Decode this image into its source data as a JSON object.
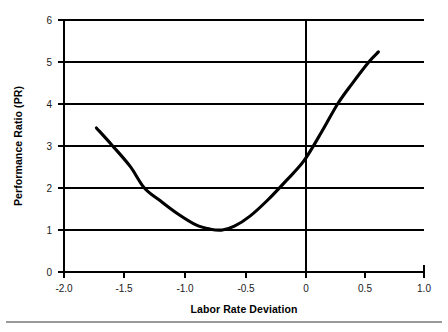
{
  "chart_data": {
    "type": "line",
    "title": "",
    "xlabel": "Labor Rate Deviation",
    "ylabel": "Performance Ratio (PR)",
    "xlim": [
      -2.0,
      1.0
    ],
    "ylim": [
      0,
      6
    ],
    "grid": "horizontal",
    "legend": "none",
    "xticks": [
      -2.0,
      -1.5,
      -1.0,
      -0.5,
      0,
      0.5,
      1.0
    ],
    "xticklabels": [
      "-2.0",
      "-1.5",
      "-1.0",
      "-0.5",
      "0",
      "0.5",
      "1.0"
    ],
    "yticks": [
      0,
      1,
      2,
      3,
      4,
      5,
      6
    ],
    "yticklabels": [
      "0",
      "1",
      "2",
      "3",
      "4",
      "5",
      "6"
    ],
    "annotations": [
      {
        "name": "vertical-reference-line",
        "x": 0
      }
    ],
    "series": [
      {
        "name": "Performance Ratio curve",
        "color": "#000000",
        "x": [
          -1.73,
          -1.6,
          -1.45,
          -1.33,
          -1.2,
          -1.05,
          -0.9,
          -0.78,
          -0.68,
          -0.58,
          -0.45,
          -0.3,
          -0.15,
          0.0,
          0.15,
          0.28,
          0.4,
          0.54,
          0.62
        ],
        "y": [
          3.43,
          3.02,
          2.52,
          2.0,
          1.7,
          1.38,
          1.12,
          1.02,
          1.0,
          1.09,
          1.33,
          1.72,
          2.17,
          2.65,
          3.35,
          4.0,
          4.48,
          5.0,
          5.24
        ],
        "minimum": {
          "x": -0.68,
          "y": 1.0
        },
        "endpoints": {
          "left": {
            "x": -1.73,
            "y": 3.43
          },
          "right": {
            "x": 0.62,
            "y": 5.24
          }
        }
      }
    ]
  },
  "labels": {
    "xaxis_title": "Labor Rate Deviation",
    "yaxis_title": "Performance Ratio (PR)",
    "x_ticks": [
      "-2.0",
      "-1.5",
      "-1.0",
      "-0.5",
      "0",
      "0.5",
      "1.0"
    ],
    "y_ticks": [
      "0",
      "1",
      "2",
      "3",
      "4",
      "5",
      "6"
    ]
  }
}
